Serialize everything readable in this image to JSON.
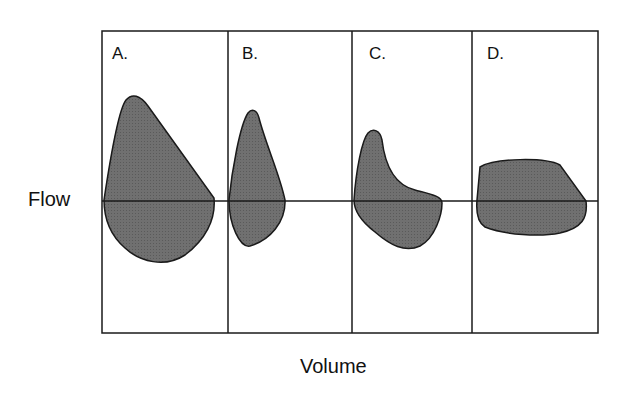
{
  "diagram": {
    "y_axis_label": "Flow",
    "x_axis_label": "Volume",
    "panels": [
      {
        "label": "A.",
        "shape": "large loop, tall peak inspiratory/expiratory flow"
      },
      {
        "label": "B.",
        "shape": "narrow tall loop"
      },
      {
        "label": "C.",
        "shape": "scooped concave loop"
      },
      {
        "label": "D.",
        "shape": "flattened truncated loop"
      }
    ],
    "colors": {
      "fill": "#6e6e6e",
      "stroke": "#1a1a1a",
      "background": "#ffffff"
    }
  }
}
